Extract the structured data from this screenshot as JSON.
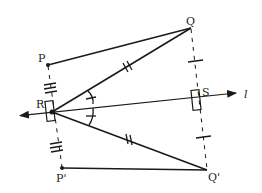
{
  "diagram": {
    "type": "geometry-reflection",
    "stroke_color": "#1a1a1a",
    "points": {
      "P": {
        "label": "P",
        "x": 48,
        "y": 65
      },
      "Q": {
        "label": "Q",
        "x": 191,
        "y": 28
      },
      "R": {
        "label": "R",
        "x": 52,
        "y": 112
      },
      "S": {
        "label": "S",
        "x": 197,
        "y": 100
      },
      "P_prime": {
        "label": "P'",
        "x": 62,
        "y": 168
      },
      "Q_prime": {
        "label": "Q'",
        "x": 207,
        "y": 170
      }
    },
    "line": {
      "label": "l"
    },
    "segments": [
      {
        "from": "P",
        "to": "Q",
        "style": "solid"
      },
      {
        "from": "R",
        "to": "Q",
        "style": "solid",
        "ticks": 2
      },
      {
        "from": "R",
        "to": "Q'",
        "style": "solid",
        "ticks": 2
      },
      {
        "from": "P'",
        "to": "Q'",
        "style": "solid"
      },
      {
        "from": "P",
        "to": "P'",
        "style": "dashed",
        "ticks": 3
      },
      {
        "from": "Q",
        "to": "Q'",
        "style": "dashed",
        "ticks": 1
      }
    ],
    "right_angles": [
      "R",
      "S"
    ],
    "equal_angles": [
      "QRS",
      "SRQ'"
    ]
  }
}
